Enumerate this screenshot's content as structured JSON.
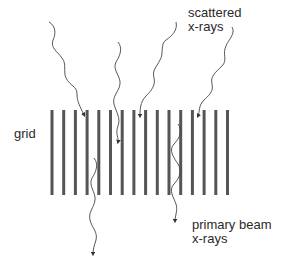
{
  "diagram": {
    "labels": {
      "grid": "grid",
      "scattered": {
        "line1": "scattered",
        "line2": "x-rays"
      },
      "primary": {
        "line1": "primary beam",
        "line2": "x-rays"
      }
    },
    "grid": {
      "bar_count": 16,
      "bar_x": [
        52,
        63.7,
        75.4,
        87.1,
        98.8,
        110.5,
        122.2,
        133.9,
        145.6,
        157.3,
        169,
        180.7,
        192.4,
        204.1,
        215.8,
        227.5
      ],
      "top": 110,
      "bottom": 195,
      "bar_width": 3,
      "color": "#555555"
    },
    "rays": {
      "color": "#444444",
      "scattered": [
        {
          "start": [
            49,
            22
          ],
          "end": [
            84,
            116
          ]
        },
        {
          "start": [
            118,
            42
          ],
          "end": [
            118,
            143
          ]
        },
        {
          "start": [
            176,
            22
          ],
          "end": [
            140,
            117
          ]
        },
        {
          "start": [
            232,
            27
          ],
          "end": [
            198,
            117
          ]
        }
      ],
      "primary": [
        {
          "start": [
            94,
            158
          ],
          "end": [
            93,
            255
          ]
        },
        {
          "start": [
            178,
            124
          ],
          "end": [
            175,
            222
          ]
        }
      ]
    }
  }
}
